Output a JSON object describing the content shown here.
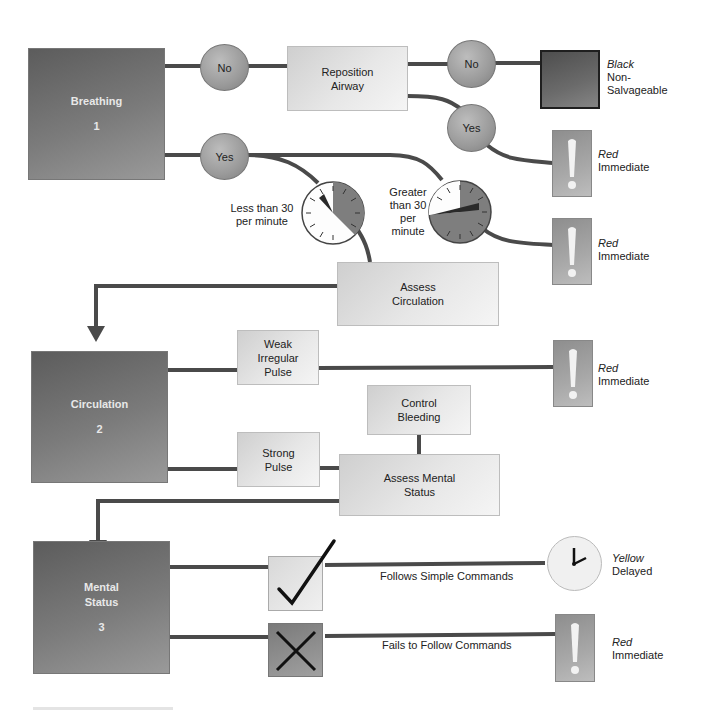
{
  "stages": [
    {
      "title": "Breathing",
      "number": "1"
    },
    {
      "title": "Circulation",
      "number": "2"
    },
    {
      "title": "Mental Status",
      "number": "3"
    }
  ],
  "breathing": {
    "no_1": "No",
    "reposition_airway": "Reposition Airway",
    "no_2": "No",
    "yes_1": "Yes",
    "yes_2": "Yes",
    "less_than_30": "Less than 30 per minute",
    "greater_than_30": "Greater than 30 per minute",
    "assess_circulation": "Assess Circulation"
  },
  "circulation": {
    "weak_pulse": "Weak Irregular Pulse",
    "strong_pulse": "Strong Pulse",
    "control_bleeding": "Control Bleeding",
    "assess_mental_status": "Assess Mental Status"
  },
  "mental_status": {
    "follows": "Follows Simple Commands",
    "fails": "Fails to Follow Commands"
  },
  "outcomes": [
    {
      "category": "Black",
      "description": "Non-Salvageable",
      "icon": "black-square-icon"
    },
    {
      "category": "Red",
      "description": "Immediate",
      "icon": "exclamation-icon"
    },
    {
      "category": "Red",
      "description": "Immediate",
      "icon": "exclamation-icon"
    },
    {
      "category": "Red",
      "description": "Immediate",
      "icon": "exclamation-icon"
    },
    {
      "category": "Yellow",
      "description": "Delayed",
      "icon": "clock-icon"
    },
    {
      "category": "Red",
      "description": "Immediate",
      "icon": "exclamation-icon"
    }
  ],
  "colors": {
    "connector": "#4a4a4a",
    "stage_box": "#6e6e6e",
    "process_box": "#e2e2e2",
    "decision_circle": "#a0a0a0"
  }
}
